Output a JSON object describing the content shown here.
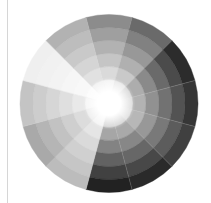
{
  "wheel": {
    "center": [
      109,
      103.5
    ],
    "outer_radius": 89,
    "inner_white_radius": 11,
    "rings": 6,
    "sector_start_angle_deg": -15,
    "sector_count": 12,
    "center_color": "#ffffff",
    "separator_color": "#d0d0d0",
    "sectors": [
      {
        "name": "sector-0",
        "outer": "#8c8c8c",
        "inner": "#f2f2f2"
      },
      {
        "name": "sector-1",
        "outer": "#6a6a6a",
        "inner": "#e6e6e6"
      },
      {
        "name": "sector-2",
        "outer": "#2c2c2c",
        "inner": "#d4d4d4"
      },
      {
        "name": "sector-3",
        "outer": "#363636",
        "inner": "#d8d8d8"
      },
      {
        "name": "sector-4",
        "outer": "#404040",
        "inner": "#dcdcdc"
      },
      {
        "name": "sector-5",
        "outer": "#2a2a2a",
        "inner": "#d0d0d0"
      },
      {
        "name": "sector-6",
        "outer": "#222222",
        "inner": "#cfcfcf"
      },
      {
        "name": "sector-7",
        "outer": "#bcbcbc",
        "inner": "#f2f2f2"
      },
      {
        "name": "sector-8",
        "outer": "#a9a9a9",
        "inner": "#ececec"
      },
      {
        "name": "sector-9",
        "outer": "#c4c4c4",
        "inner": "#f4f4f4"
      },
      {
        "name": "sector-10",
        "outer": "#efefef",
        "inner": "#fbfbfb"
      },
      {
        "name": "sector-11",
        "outer": "#b2b2b2",
        "inner": "#f0f0f0"
      }
    ]
  }
}
